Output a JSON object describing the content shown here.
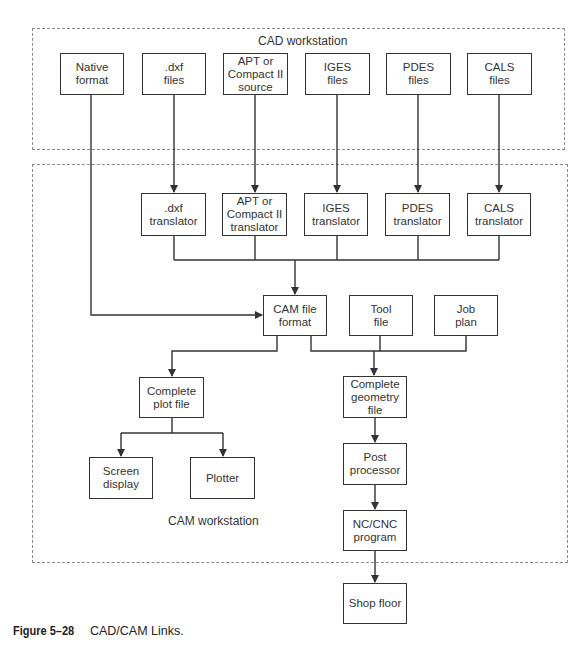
{
  "diagram": {
    "groups": {
      "cad": {
        "label": "CAD workstation"
      },
      "cam": {
        "label": "CAM workstation"
      }
    },
    "nodes": {
      "native_format": "Native\nformat",
      "dxf_files": ".dxf\nfiles",
      "apt_source": "APT or\nCompact II\nsource",
      "iges_files": "IGES\nfiles",
      "pdes_files": "PDES\nfiles",
      "cals_files": "CALS\nfiles",
      "dxf_translator": ".dxf\ntranslator",
      "apt_translator": "APT or\nCompact II\ntranslator",
      "iges_translator": "IGES\ntranslator",
      "pdes_translator": "PDES\ntranslator",
      "cals_translator": "CALS\ntranslator",
      "cam_file_format": "CAM file\nformat",
      "tool_file": "Tool\nfile",
      "job_plan": "Job\nplan",
      "complete_plot_file": "Complete\nplot file",
      "complete_geometry_file": "Complete\ngeometry\nfile",
      "screen_display": "Screen\ndisplay",
      "plotter": "Plotter",
      "post_processor": "Post\nprocessor",
      "nc_cnc_program": "NC/CNC\nprogram",
      "shop_floor": "Shop floor"
    },
    "edges": [
      [
        "dxf_files",
        "dxf_translator"
      ],
      [
        "apt_source",
        "apt_translator"
      ],
      [
        "iges_files",
        "iges_translator"
      ],
      [
        "pdes_files",
        "pdes_translator"
      ],
      [
        "cals_files",
        "cals_translator"
      ],
      [
        "native_format",
        "cam_file_format"
      ],
      [
        "dxf_translator",
        "cam_file_format"
      ],
      [
        "apt_translator",
        "cam_file_format"
      ],
      [
        "iges_translator",
        "cam_file_format"
      ],
      [
        "pdes_translator",
        "cam_file_format"
      ],
      [
        "cals_translator",
        "cam_file_format"
      ],
      [
        "cam_file_format",
        "complete_plot_file"
      ],
      [
        "cam_file_format",
        "complete_geometry_file"
      ],
      [
        "tool_file",
        "complete_geometry_file"
      ],
      [
        "job_plan",
        "complete_geometry_file"
      ],
      [
        "complete_plot_file",
        "screen_display"
      ],
      [
        "complete_plot_file",
        "plotter"
      ],
      [
        "complete_geometry_file",
        "post_processor"
      ],
      [
        "post_processor",
        "nc_cnc_program"
      ],
      [
        "nc_cnc_program",
        "shop_floor"
      ]
    ]
  },
  "caption": {
    "figure_number": "Figure 5–28",
    "title": "CAD/CAM Links."
  }
}
